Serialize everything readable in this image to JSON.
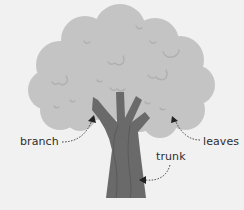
{
  "diagram": {
    "labels": {
      "branch": "branch",
      "leaves": "leaves",
      "trunk": "trunk"
    },
    "colors": {
      "background": "#f1f1f1",
      "leaves": "#c4c4c4",
      "leaf_detail": "#b2b2b2",
      "trunk": "#6a6a6a",
      "trunk_line": "#5a5a5a",
      "arrow": "#3a3a3a",
      "text": "#2e2e2e"
    }
  }
}
